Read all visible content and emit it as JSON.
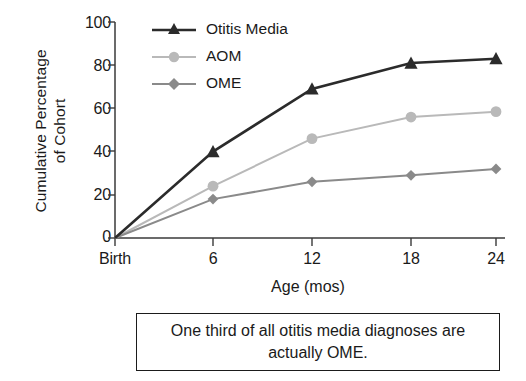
{
  "chart_data": {
    "type": "line",
    "title": "",
    "xlabel": "Age (mos)",
    "ylabel": "Cumulative Percentage of Cohort",
    "ylabel_line1": "Cumulative Percentage",
    "ylabel_line2": "of Cohort",
    "categories": [
      "Birth",
      "6",
      "12",
      "18",
      "24"
    ],
    "x": [
      0,
      6,
      12,
      18,
      24
    ],
    "xlim": [
      0,
      24
    ],
    "ylim": [
      0,
      100
    ],
    "yticks": [
      0,
      20,
      40,
      60,
      80,
      100
    ],
    "ytick_labels": [
      "0",
      "20",
      "40",
      "60",
      "80",
      "100"
    ],
    "grid": false,
    "legend_position": "top-left-inside",
    "series": [
      {
        "name": "Otitis Media",
        "values": [
          0,
          40,
          69,
          81,
          83
        ],
        "color": "#2b2b2b",
        "marker": "triangle"
      },
      {
        "name": "AOM",
        "values": [
          0,
          24,
          46,
          56,
          58.5
        ],
        "color": "#b9b9b9",
        "marker": "circle"
      },
      {
        "name": "OME",
        "values": [
          0,
          18,
          26,
          29,
          32
        ],
        "color": "#8a8a8a",
        "marker": "diamond"
      }
    ]
  },
  "caption": {
    "line1": "One third of all otitis media diagnoses are",
    "line2": "actually OME.",
    "full": "One third of all otitis media diagnoses are actually OME."
  },
  "colors": {
    "axis": "#3a3a3a",
    "text": "#1a1a1a",
    "otitis_media": "#2b2b2b",
    "aom": "#b9b9b9",
    "ome": "#8a8a8a",
    "caption_border": "#1b1b1b",
    "background": "#ffffff"
  }
}
